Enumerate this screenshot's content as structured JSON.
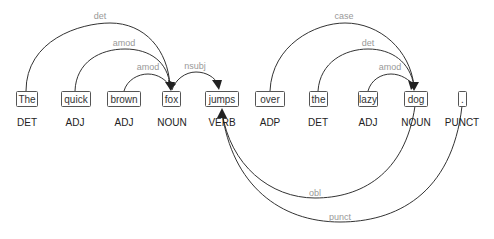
{
  "diagram": {
    "type": "dependency-parse",
    "tokens": [
      {
        "text": "The",
        "pos": "DET"
      },
      {
        "text": "quick",
        "pos": "ADJ"
      },
      {
        "text": "brown",
        "pos": "ADJ"
      },
      {
        "text": "fox",
        "pos": "NOUN"
      },
      {
        "text": "jumps",
        "pos": "VERB"
      },
      {
        "text": "over",
        "pos": "ADP"
      },
      {
        "text": "the",
        "pos": "DET"
      },
      {
        "text": "lazy",
        "pos": "ADJ"
      },
      {
        "text": "dog",
        "pos": "NOUN"
      },
      {
        "text": ".",
        "pos": "PUNCT"
      }
    ],
    "arcs": [
      {
        "label": "det",
        "from": "The",
        "to": "fox"
      },
      {
        "label": "amod",
        "from": "quick",
        "to": "fox"
      },
      {
        "label": "amod",
        "from": "brown",
        "to": "fox"
      },
      {
        "label": "nsubj",
        "from": "fox",
        "to": "jumps"
      },
      {
        "label": "case",
        "from": "over",
        "to": "dog"
      },
      {
        "label": "det",
        "from": "the",
        "to": "dog"
      },
      {
        "label": "amod",
        "from": "lazy",
        "to": "dog"
      },
      {
        "label": "obl",
        "from": "dog",
        "to": "jumps"
      },
      {
        "label": "punct",
        "from": ".",
        "to": "jumps"
      }
    ]
  }
}
